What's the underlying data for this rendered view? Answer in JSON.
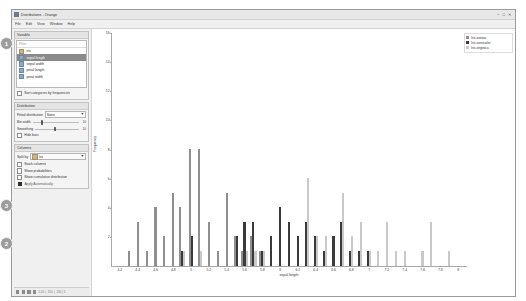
{
  "window": {
    "title": "Distributions - Orange",
    "icon": "orange-app-icon",
    "controls": {
      "minimize": "─",
      "maximize": "□",
      "close": "✕"
    }
  },
  "menu": {
    "items": [
      "File",
      "Edit",
      "View",
      "Window",
      "Help"
    ]
  },
  "variable_panel": {
    "header": "Variable",
    "search_placeholder": "Filter",
    "items": [
      {
        "label": "iris",
        "icon": "categorical-variable-icon",
        "kind": "cat",
        "selected": false
      },
      {
        "label": "sepal length",
        "icon": "numeric-variable-icon",
        "kind": "num",
        "selected": true
      },
      {
        "label": "sepal width",
        "icon": "numeric-variable-icon",
        "kind": "num",
        "selected": false
      },
      {
        "label": "petal length",
        "icon": "numeric-variable-icon",
        "kind": "num",
        "selected": false
      },
      {
        "label": "petal width",
        "icon": "numeric-variable-icon",
        "kind": "num",
        "selected": false
      }
    ],
    "sort_checkbox": {
      "label": "Sort categories by frequencies",
      "checked": false
    }
  },
  "distribution_panel": {
    "header": "Distribution",
    "fitted_label": "Fitted distribution",
    "fitted_value": "None",
    "bin_width_label": "Bin width",
    "bin_width_value": "10",
    "smoothing_label": "Smoothing",
    "smoothing_value": "10",
    "hide_bars_checkbox": {
      "label": "Hide bars",
      "checked": false
    }
  },
  "columns_panel": {
    "header": "Columns",
    "split_by_label": "Split by",
    "split_by_value": "iris",
    "split_by_icon": "categorical-variable-icon",
    "checkboxes": [
      {
        "label": "Stack columns",
        "checked": false
      },
      {
        "label": "Show probabilities",
        "checked": false
      },
      {
        "label": "Show cumulative distribution",
        "checked": false
      }
    ],
    "apply_label": "Apply Automatically",
    "apply_icon": "apply-automatically-icon"
  },
  "status_bar": {
    "icons": [
      "info-icon",
      "input-icon",
      "output-icon",
      "report-icon",
      "settings-icon",
      "help-icon"
    ],
    "text": "1.00 │ 150 │ 150 | 5"
  },
  "annotations": [
    {
      "number": "1",
      "x": 0,
      "y": 37
    },
    {
      "number": "3",
      "x": 0,
      "y": 199
    },
    {
      "number": "2",
      "x": 0,
      "y": 237
    }
  ],
  "legend": {
    "title": "",
    "entries": [
      {
        "label": "Iris-setosa",
        "color": "#8f8f8f"
      },
      {
        "label": "Iris-versicolor",
        "color": "#3a3a3a"
      },
      {
        "label": "Iris-virginica",
        "color": "#c9c9c9"
      }
    ]
  },
  "chart_data": {
    "type": "bar",
    "title": "",
    "xlabel": "sepal length",
    "ylabel": "Frequency",
    "grid": false,
    "legend_position": "top-right",
    "stacked": false,
    "xlim": [
      4.1,
      8.1
    ],
    "ylim": [
      0,
      16
    ],
    "yticks": [
      0,
      2,
      4,
      6,
      8,
      10,
      12,
      14,
      16
    ],
    "ytick_labels": [
      "0",
      "2",
      "4",
      "6",
      "8",
      "10",
      "12",
      "14",
      "16"
    ],
    "xticks": [
      4.2,
      4.4,
      4.6,
      4.8,
      5,
      5.2,
      5.4,
      5.6,
      5.8,
      6,
      6.2,
      6.4,
      6.6,
      6.8,
      7,
      7.2,
      7.4,
      7.6,
      7.8,
      8
    ],
    "xtick_labels": [
      "4.2",
      "4.4",
      "4.6",
      "4.8",
      "5",
      "5.2",
      "5.4",
      "5.6",
      "5.8",
      "6",
      "6.2",
      "6.4",
      "6.6",
      "6.8",
      "7",
      "7.2",
      "7.4",
      "7.6",
      "7.8",
      "8"
    ],
    "categories": [
      "4.3",
      "4.4",
      "4.5",
      "4.6",
      "4.7",
      "4.8",
      "4.9",
      "5",
      "5.1",
      "5.2",
      "5.3",
      "5.4",
      "5.5",
      "5.6",
      "5.7",
      "5.8",
      "5.9",
      "6",
      "6.1",
      "6.2",
      "6.3",
      "6.4",
      "6.5",
      "6.6",
      "6.7",
      "6.8",
      "6.9",
      "7",
      "7.1",
      "7.2",
      "7.3",
      "7.4",
      "7.6",
      "7.7",
      "7.9"
    ],
    "series": [
      {
        "name": "Iris-setosa",
        "color": "#8f8f8f",
        "values": [
          1,
          3,
          1,
          4,
          2,
          5,
          4,
          8,
          8,
          3,
          1,
          5,
          2,
          1,
          2,
          1,
          0,
          0,
          0,
          0,
          0,
          0,
          0,
          0,
          0,
          0,
          0,
          0,
          0,
          0,
          0,
          0,
          0,
          0,
          0
        ]
      },
      {
        "name": "Iris-versicolor",
        "color": "#3a3a3a",
        "values": [
          0,
          0,
          0,
          0,
          0,
          0,
          1,
          2,
          0,
          0,
          0,
          0,
          2,
          3,
          3,
          1,
          2,
          4,
          3,
          2,
          3,
          2,
          1,
          2,
          3,
          1,
          1,
          1,
          0,
          0,
          0,
          0,
          0,
          0,
          0
        ]
      },
      {
        "name": "Iris-virginica",
        "color": "#c9c9c9",
        "values": [
          0,
          0,
          0,
          0,
          0,
          0,
          1,
          0,
          1,
          0,
          0,
          0,
          0,
          1,
          1,
          1,
          0,
          0,
          0,
          0,
          6,
          2,
          2,
          0,
          5,
          2,
          3,
          1,
          1,
          3,
          1,
          1,
          1,
          3,
          1
        ]
      }
    ]
  }
}
